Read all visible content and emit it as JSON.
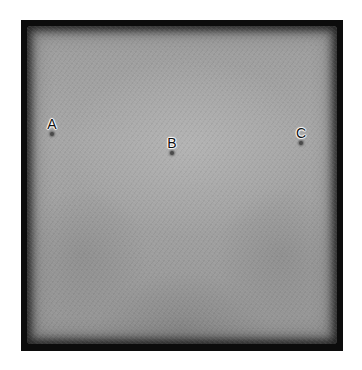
{
  "image": {
    "description": "Grayscale radiograph-like square plate with a thick black border and three labeled point markers",
    "colors": {
      "border": "#0c0c0c",
      "plate": "#a0a0a0",
      "label_text": "#111111",
      "label_halo": "#ffffff",
      "dot": "#4a4a4a"
    }
  },
  "markers": [
    {
      "label": "A",
      "x": 52,
      "y": 118
    },
    {
      "label": "B",
      "x": 172,
      "y": 137
    },
    {
      "label": "C",
      "x": 301,
      "y": 127
    }
  ]
}
